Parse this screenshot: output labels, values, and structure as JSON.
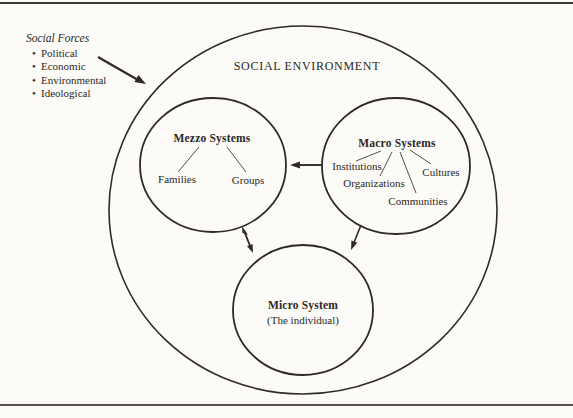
{
  "page": {
    "background": "#fcfbf7",
    "ink": "#2b2824"
  },
  "social_forces": {
    "title": "Social Forces",
    "bullet": "•",
    "items": [
      "Political",
      "Economic",
      "Environmental",
      "Ideological"
    ]
  },
  "environment": {
    "label": "SOCIAL ENVIRONMENT"
  },
  "systems": {
    "mezzo": {
      "title": "Mezzo Systems",
      "children": [
        "Families",
        "Groups"
      ]
    },
    "macro": {
      "title": "Macro Systems",
      "children": [
        "Institutions",
        "Cultures",
        "Organizations",
        "Communities"
      ]
    },
    "micro": {
      "title": "Micro System",
      "subtitle": "(The individual)"
    }
  }
}
